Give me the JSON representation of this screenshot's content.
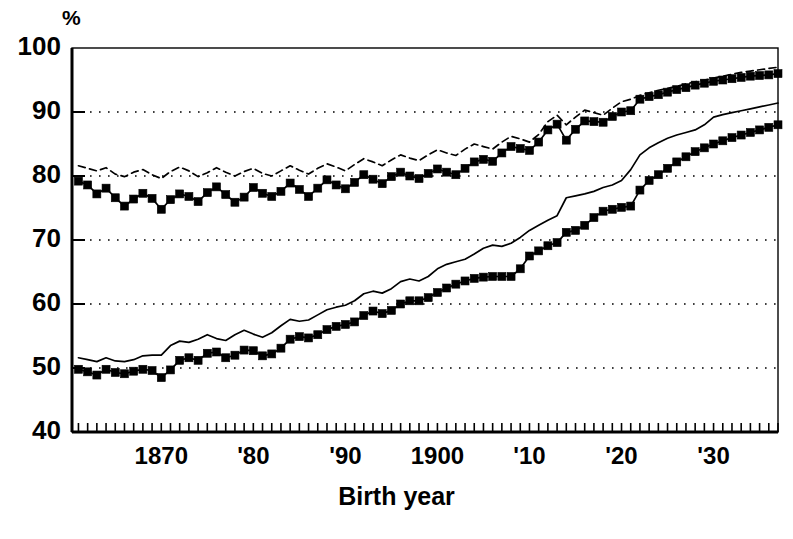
{
  "chart_data": {
    "type": "line",
    "title": "",
    "subtitle": "",
    "xlabel": "Birth year",
    "ylabel": "%",
    "yunit": "%",
    "xlim": [
      1860.3,
      1937.0
    ],
    "ylim": [
      40,
      100
    ],
    "yticks": [
      40,
      50,
      60,
      70,
      80,
      90,
      100
    ],
    "ytick_labels": [
      "40",
      "50",
      "60",
      "70",
      "80",
      "90",
      "100"
    ],
    "xticks": [
      1870,
      1880,
      1890,
      1900,
      1910,
      1920,
      1930
    ],
    "xtick_labels": [
      "1870",
      "'80",
      "'90",
      "1900",
      "'10",
      "'20",
      "'30"
    ],
    "x_minor_tick_interval": 1,
    "grid": "horizontal-dotted",
    "legend": "none",
    "legend_position": "none",
    "line_color": "#000000",
    "background_color": "#ffffff",
    "x": [
      1861,
      1862,
      1863,
      1864,
      1865,
      1866,
      1867,
      1868,
      1869,
      1870,
      1871,
      1872,
      1873,
      1874,
      1875,
      1876,
      1877,
      1878,
      1879,
      1880,
      1881,
      1882,
      1883,
      1884,
      1885,
      1886,
      1887,
      1888,
      1889,
      1890,
      1891,
      1892,
      1893,
      1894,
      1895,
      1896,
      1897,
      1898,
      1899,
      1900,
      1901,
      1902,
      1903,
      1904,
      1905,
      1906,
      1907,
      1908,
      1909,
      1910,
      1911,
      1912,
      1913,
      1914,
      1915,
      1916,
      1917,
      1918,
      1919,
      1920,
      1921,
      1922,
      1923,
      1924,
      1925,
      1926,
      1927,
      1928,
      1929,
      1930,
      1931,
      1932,
      1933,
      1934,
      1935,
      1936,
      1937
    ],
    "series": [
      {
        "name": "upper-dashed",
        "style": "dashed",
        "marker": "none",
        "values": [
          81.6,
          81.2,
          80.8,
          81.3,
          80.3,
          79.9,
          80.6,
          81.0,
          80.2,
          79.6,
          80.7,
          81.4,
          80.8,
          79.9,
          80.5,
          81.3,
          80.6,
          80.0,
          80.7,
          81.2,
          80.4,
          80.0,
          80.8,
          81.6,
          80.9,
          80.3,
          81.2,
          81.9,
          81.4,
          80.8,
          81.8,
          82.7,
          82.2,
          81.6,
          82.5,
          83.3,
          82.8,
          82.4,
          83.3,
          84.1,
          83.6,
          83.2,
          84.2,
          85.0,
          84.6,
          84.2,
          85.3,
          86.2,
          85.8,
          85.3,
          86.5,
          88.5,
          89.5,
          88.0,
          89.2,
          90.3,
          89.9,
          89.5,
          90.6,
          91.6,
          92.0,
          92.6,
          93.0,
          93.4,
          93.7,
          94.0,
          94.4,
          94.7,
          95.0,
          95.3,
          95.6,
          95.9,
          96.2,
          96.4,
          96.6,
          96.8,
          97.0
        ]
      },
      {
        "name": "upper-squares",
        "style": "solid",
        "marker": "square",
        "values": [
          79.2,
          78.6,
          77.2,
          78.1,
          76.6,
          75.3,
          76.4,
          77.3,
          76.5,
          74.8,
          76.3,
          77.2,
          76.8,
          76.0,
          77.4,
          78.3,
          77.1,
          75.9,
          76.7,
          78.2,
          77.3,
          76.8,
          77.6,
          78.9,
          77.9,
          76.8,
          78.1,
          79.4,
          78.6,
          78.0,
          79.0,
          80.2,
          79.5,
          78.8,
          79.9,
          80.6,
          80.0,
          79.6,
          80.4,
          81.1,
          80.6,
          80.2,
          81.2,
          82.2,
          82.6,
          82.3,
          83.6,
          84.6,
          84.3,
          84.0,
          85.3,
          87.2,
          88.1,
          85.6,
          87.3,
          88.6,
          88.5,
          88.4,
          89.3,
          90.0,
          90.2,
          92.0,
          92.4,
          92.7,
          93.1,
          93.5,
          93.8,
          94.2,
          94.5,
          94.8,
          95.0,
          95.2,
          95.4,
          95.6,
          95.7,
          95.8,
          96.0
        ]
      },
      {
        "name": "lower-solid",
        "style": "solid",
        "marker": "none",
        "values": [
          51.6,
          51.3,
          51.0,
          51.6,
          51.1,
          51.0,
          51.3,
          51.9,
          52.0,
          52.0,
          53.5,
          54.2,
          54.0,
          54.5,
          55.2,
          54.6,
          54.3,
          55.2,
          55.9,
          55.3,
          54.8,
          55.5,
          56.6,
          57.6,
          57.3,
          57.5,
          58.3,
          59.1,
          59.5,
          59.8,
          60.5,
          61.6,
          62.0,
          61.7,
          62.4,
          63.5,
          63.9,
          63.6,
          64.3,
          65.5,
          66.2,
          66.6,
          67.0,
          67.8,
          68.7,
          69.2,
          69.0,
          69.5,
          70.4,
          71.5,
          72.3,
          73.1,
          73.8,
          76.6,
          76.9,
          77.2,
          77.6,
          78.2,
          78.6,
          79.3,
          81.0,
          83.3,
          84.4,
          85.2,
          85.9,
          86.4,
          86.8,
          87.2,
          88.0,
          89.2,
          89.6,
          89.9,
          90.2,
          90.5,
          90.8,
          91.1,
          91.4
        ]
      },
      {
        "name": "lower-squares",
        "style": "solid",
        "marker": "square",
        "values": [
          49.8,
          49.4,
          48.9,
          49.8,
          49.3,
          49.1,
          49.5,
          49.8,
          49.6,
          48.5,
          49.7,
          51.2,
          51.6,
          51.2,
          52.3,
          52.5,
          51.6,
          52.0,
          52.8,
          52.7,
          51.9,
          52.2,
          53.1,
          54.5,
          54.9,
          54.7,
          55.2,
          56.0,
          56.5,
          56.8,
          57.2,
          58.2,
          58.9,
          58.5,
          59.0,
          60.0,
          60.5,
          60.5,
          61.0,
          61.8,
          62.5,
          63.1,
          63.6,
          64.0,
          64.2,
          64.3,
          64.3,
          64.3,
          65.5,
          67.5,
          68.3,
          69.1,
          69.6,
          71.2,
          71.5,
          72.3,
          73.5,
          74.5,
          74.8,
          75.1,
          75.3,
          77.8,
          79.3,
          80.2,
          81.2,
          82.2,
          83.0,
          83.8,
          84.4,
          85.0,
          85.5,
          86.0,
          86.4,
          86.8,
          87.2,
          87.6,
          88.0
        ]
      }
    ]
  },
  "labels": {
    "y_unit": "%",
    "x_title": "Birth year"
  }
}
